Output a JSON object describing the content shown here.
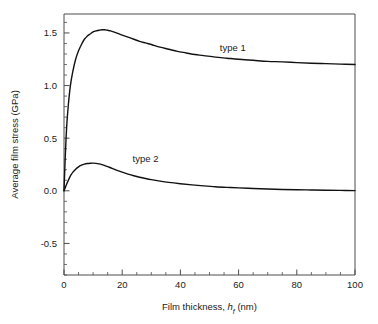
{
  "chart_data": {
    "type": "line",
    "title": "",
    "xlabel": "Film thickness, h_f (nm)",
    "xlabel_parts": {
      "prefix": "Film thickness, ",
      "symbol": "h",
      "subscript": "f",
      "suffix": " (nm)"
    },
    "ylabel": "Average film stress (GPa)",
    "xlim": [
      0,
      100
    ],
    "ylim": [
      -0.8,
      1.68
    ],
    "xticks": [
      0,
      20,
      40,
      60,
      80,
      100
    ],
    "xtick_labels": [
      "0",
      "20",
      "40",
      "60",
      "80",
      "100"
    ],
    "xtick_minor_step": 5,
    "yticks": [
      -0.5,
      0.0,
      0.5,
      1.0,
      1.5
    ],
    "ytick_labels": [
      "-0.5",
      "0.0",
      "0.5",
      "1.0",
      "1.5"
    ],
    "ytick_minor_step": 0.1,
    "grid": false,
    "legend_position": "inline-annotation",
    "series": [
      {
        "name": "type 1",
        "label": "type 1",
        "label_x": 58,
        "label_y": 1.33,
        "color": "#111111",
        "x": [
          0,
          0.4,
          0.9,
          1.5,
          2.2,
          3,
          4,
          5,
          6,
          7,
          8,
          9,
          10,
          11,
          12,
          13,
          14,
          15,
          16,
          18,
          20,
          22,
          24,
          26,
          28,
          30,
          33,
          36,
          39,
          42,
          45,
          48,
          52,
          56,
          60,
          65,
          70,
          75,
          80,
          85,
          90,
          95,
          100
        ],
        "y": [
          0.0,
          0.3,
          0.6,
          0.82,
          1.0,
          1.13,
          1.25,
          1.33,
          1.39,
          1.44,
          1.47,
          1.49,
          1.51,
          1.52,
          1.525,
          1.53,
          1.53,
          1.525,
          1.52,
          1.5,
          1.48,
          1.46,
          1.44,
          1.42,
          1.405,
          1.39,
          1.365,
          1.345,
          1.325,
          1.31,
          1.295,
          1.285,
          1.27,
          1.26,
          1.25,
          1.24,
          1.23,
          1.225,
          1.218,
          1.212,
          1.208,
          1.204,
          1.2
        ]
      },
      {
        "name": "type 2",
        "label": "type 2",
        "label_x": 28,
        "label_y": 0.27,
        "color": "#111111",
        "x": [
          0,
          0.5,
          1,
          1.5,
          2,
          2.5,
          3,
          4,
          5,
          6,
          7,
          8,
          9,
          10,
          11,
          12,
          13,
          14,
          15,
          16,
          18,
          20,
          22,
          24,
          26,
          28,
          30,
          33,
          36,
          40,
          44,
          48,
          52,
          56,
          60,
          65,
          70,
          75,
          80,
          85,
          90,
          95,
          100
        ],
        "y": [
          0.0,
          0.035,
          0.07,
          0.1,
          0.13,
          0.155,
          0.175,
          0.205,
          0.228,
          0.243,
          0.253,
          0.259,
          0.262,
          0.263,
          0.261,
          0.256,
          0.249,
          0.24,
          0.23,
          0.219,
          0.197,
          0.177,
          0.159,
          0.143,
          0.129,
          0.117,
          0.106,
          0.092,
          0.08,
          0.067,
          0.056,
          0.047,
          0.039,
          0.033,
          0.028,
          0.022,
          0.017,
          0.013,
          0.01,
          0.008,
          0.006,
          0.004,
          0.002
        ]
      }
    ]
  }
}
